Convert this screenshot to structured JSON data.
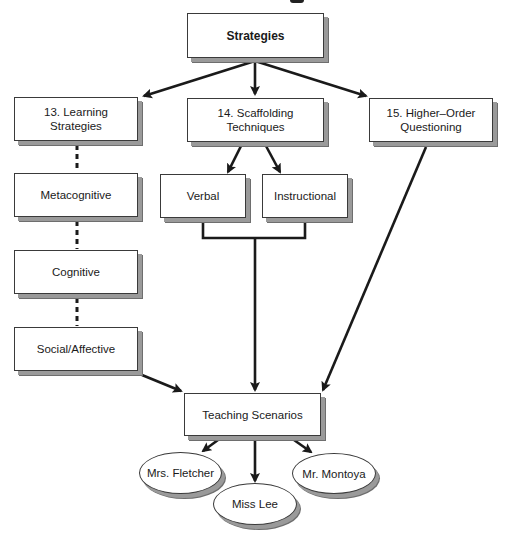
{
  "diagram": {
    "root": {
      "label": "Strategies"
    },
    "branches": [
      {
        "label": "13. Learning\n   Strategies"
      },
      {
        "label": "14. Scaffolding\n   Techniques"
      },
      {
        "label": "15. Higher–Order\n   Questioning"
      }
    ],
    "learning_strategies": [
      {
        "label": "Metacognitive"
      },
      {
        "label": "Cognitive"
      },
      {
        "label": "Social/Affective"
      }
    ],
    "scaffolding_types": [
      {
        "label": "Verbal"
      },
      {
        "label": "Instructional"
      }
    ],
    "outcome": {
      "label": "Teaching Scenarios"
    },
    "scenarios": [
      {
        "label": "Mrs. Fletcher"
      },
      {
        "label": "Miss Lee"
      },
      {
        "label": "Mr. Montoya"
      }
    ],
    "colors": {
      "line": "#1a1a1a",
      "border": "#3a3a3a",
      "shadow": "#9a9a9a",
      "background": "#ffffff"
    }
  }
}
